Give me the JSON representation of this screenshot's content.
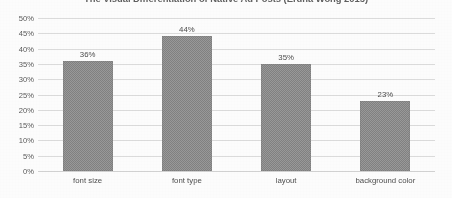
{
  "chart_data": {
    "type": "bar",
    "title": "The Visual Differentiation of Native Ad Posts (Erdna Wong 2015)",
    "xlabel": "",
    "ylabel": "",
    "categories": [
      "font size",
      "font type",
      "layout",
      "background color"
    ],
    "values": [
      36,
      44,
      35,
      23
    ],
    "data_labels": [
      "36%",
      "44%",
      "35%",
      "23%"
    ],
    "ylim": [
      0,
      50
    ],
    "ytick_values": [
      50,
      45,
      40,
      35,
      30,
      25,
      20,
      15,
      10,
      5,
      0
    ],
    "ytick_labels": [
      "50%",
      "45%",
      "40%",
      "35%",
      "30%",
      "25%",
      "20%",
      "15%",
      "10%",
      "5%",
      "0%"
    ],
    "grid": true,
    "legend": false,
    "legend_position": "none",
    "series": [
      {
        "name": "share of respondents",
        "values": [
          36,
          44,
          35,
          23
        ]
      }
    ],
    "colors": {
      "bar_fill": "#8c8c8c",
      "bar_pattern_light": "#9a9a9a",
      "bar_pattern_dark": "#828282",
      "gridline": "#dcdcdc",
      "tick_text": "#5a5a5a",
      "label_text": "#4d4d4d",
      "title_text": "#4a4a4a",
      "background": "#fdfdfd"
    }
  }
}
